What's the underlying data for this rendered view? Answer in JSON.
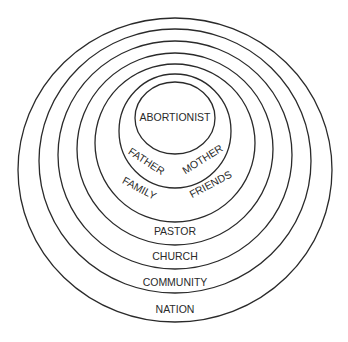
{
  "diagram": {
    "type": "nested-concentric-circles",
    "stroke_color": "#2a2a2a",
    "background": "#ffffff",
    "circles": [
      {
        "name": "nation",
        "cx": 175,
        "cy": 170,
        "rx": 157,
        "ry": 152
      },
      {
        "name": "community",
        "cx": 175,
        "cy": 161,
        "rx": 136,
        "ry": 132
      },
      {
        "name": "church",
        "cx": 175,
        "cy": 155,
        "rx": 117,
        "ry": 114
      },
      {
        "name": "pastor",
        "cx": 175,
        "cy": 149,
        "rx": 98,
        "ry": 96
      },
      {
        "name": "family-friends",
        "cx": 175,
        "cy": 143,
        "rx": 80,
        "ry": 79
      },
      {
        "name": "father-mother",
        "cx": 175,
        "cy": 131,
        "rx": 56,
        "ry": 57
      },
      {
        "name": "abortionist",
        "cx": 175,
        "cy": 118,
        "rx": 40,
        "ry": 36
      }
    ],
    "labels": {
      "abortionist": "ABORTIONIST",
      "father": "FATHER",
      "mother": "MOTHER",
      "family": "FAMILY",
      "friends": "FRIENDS",
      "pastor": "PASTOR",
      "church": "CHURCH",
      "community": "COMMUNITY",
      "nation": "NATION"
    }
  }
}
